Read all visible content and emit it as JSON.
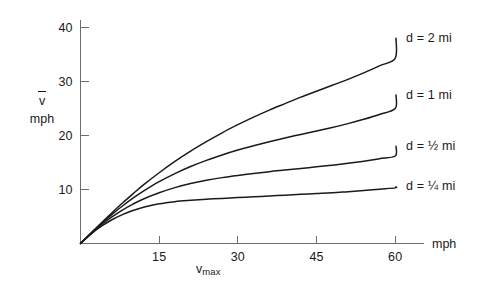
{
  "chart_data": {
    "type": "line",
    "title": "",
    "subtitle": "",
    "xlabel": "v_max",
    "xlabel_display": "v",
    "xlabel_sub": "max",
    "xlabel_unit": "mph",
    "ylabel": "v-bar",
    "ylabel_display": "v",
    "ylabel_unit": "mph",
    "xlim": [
      0,
      68
    ],
    "ylim": [
      0,
      42
    ],
    "xticks": [
      15,
      30,
      45,
      60
    ],
    "yticks": [
      10,
      20,
      30,
      40
    ],
    "xtick_labels": [
      "15",
      "30",
      "45",
      "60"
    ],
    "ytick_labels": [
      "10",
      "20",
      "30",
      "40"
    ],
    "grid": false,
    "legend_position": "right-inline",
    "line_color": "#1a1a1a",
    "axis_color": "#6e6e6e",
    "background_color": "#ffffff",
    "series": [
      {
        "name": "d = 2 mi",
        "label": "d = 2 mi",
        "d_miles": 2,
        "x": [
          0,
          2,
          4,
          6,
          8,
          10,
          12,
          15,
          18,
          21,
          24,
          27,
          30,
          33,
          36,
          39,
          42,
          45,
          48,
          51,
          54,
          57,
          60
        ],
        "values": [
          0,
          1.95,
          3.85,
          5.7,
          7.5,
          9.2,
          10.85,
          13.1,
          15.2,
          17.1,
          18.85,
          20.5,
          22.0,
          23.4,
          24.7,
          25.9,
          27.1,
          28.2,
          29.3,
          30.4,
          31.6,
          32.9,
          34.3
        ],
        "value_at_xmax": 38.0
      },
      {
        "name": "d = 1 mi",
        "label": "d = 1 mi",
        "d_miles": 1,
        "x": [
          0,
          2,
          4,
          6,
          8,
          10,
          12,
          15,
          18,
          21,
          24,
          27,
          30,
          33,
          36,
          39,
          42,
          45,
          48,
          51,
          54,
          57,
          60
        ],
        "values": [
          0,
          1.9,
          3.7,
          5.4,
          6.95,
          8.4,
          9.7,
          11.45,
          12.95,
          14.25,
          15.4,
          16.4,
          17.3,
          18.1,
          18.85,
          19.55,
          20.2,
          20.85,
          21.5,
          22.2,
          23.0,
          23.9,
          25.0
        ],
        "value_at_xmax": 27.5
      },
      {
        "name": "d = 1/2 mi",
        "label": "d = ½ mi",
        "d_miles": 0.5,
        "x": [
          0,
          2,
          4,
          6,
          8,
          10,
          12,
          15,
          18,
          21,
          24,
          27,
          30,
          33,
          36,
          39,
          42,
          45,
          48,
          51,
          54,
          57,
          60
        ],
        "values": [
          0,
          1.85,
          3.5,
          4.95,
          6.2,
          7.3,
          8.25,
          9.4,
          10.35,
          11.1,
          11.7,
          12.2,
          12.6,
          12.95,
          13.3,
          13.6,
          13.9,
          14.2,
          14.5,
          14.85,
          15.25,
          15.7,
          16.2
        ],
        "value_at_xmax": 18.0
      },
      {
        "name": "d = 1/4 mi",
        "label": "d = ¼ mi",
        "d_miles": 0.25,
        "x": [
          0,
          2,
          4,
          6,
          8,
          10,
          12,
          15,
          18,
          21,
          24,
          27,
          30,
          33,
          36,
          39,
          42,
          45,
          48,
          51,
          54,
          57,
          60
        ],
        "values": [
          0,
          1.75,
          3.2,
          4.4,
          5.35,
          6.1,
          6.7,
          7.35,
          7.75,
          8.0,
          8.2,
          8.35,
          8.5,
          8.65,
          8.8,
          8.95,
          9.1,
          9.25,
          9.4,
          9.6,
          9.8,
          10.05,
          10.3
        ],
        "value_at_xmax": 10.5
      }
    ]
  },
  "axes": {
    "y_unit_label": "mph",
    "x_unit_label": "mph"
  }
}
